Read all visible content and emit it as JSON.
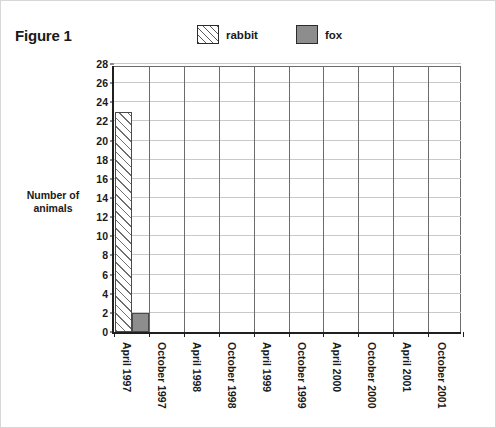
{
  "figure": {
    "title": "Figure 1"
  },
  "legend": {
    "position": "top-center",
    "entries": [
      {
        "label": "rabbit",
        "swatch": "hatched-diagonal-white",
        "color": "#ffffff"
      },
      {
        "label": "fox",
        "swatch": "solid-gray",
        "color": "#8d8d8d"
      }
    ]
  },
  "axes": {
    "y_title_line1": "Number of",
    "y_title_line2": "animals"
  },
  "chart_data": {
    "type": "bar",
    "title": "Figure 1",
    "xlabel": "",
    "ylabel": "Number of animals",
    "ylim": [
      0,
      28
    ],
    "ytick_step": 2,
    "yticks": [
      0,
      2,
      4,
      6,
      8,
      10,
      12,
      14,
      16,
      18,
      20,
      22,
      24,
      26,
      28
    ],
    "ytick_labels": [
      "0",
      "2",
      "4",
      "6",
      "8",
      "10",
      "12",
      "14",
      "16",
      "18",
      "20",
      "22",
      "24",
      "26",
      "28"
    ],
    "grid": "horizontal-and-vertical",
    "legend_position": "top-center",
    "categories": [
      "April 1997",
      "October 1997",
      "April 1998",
      "October 1998",
      "April 1999",
      "October 1999",
      "April 2000",
      "October 2000",
      "April 2001",
      "October 2001"
    ],
    "series": [
      {
        "name": "rabbit",
        "color": "#ffffff",
        "pattern": "diagonal-hatch",
        "values": [
          23,
          0,
          0,
          0,
          0,
          0,
          0,
          0,
          0,
          0
        ]
      },
      {
        "name": "fox",
        "color": "#8d8d8d",
        "pattern": "solid",
        "values": [
          2,
          0,
          0,
          0,
          0,
          0,
          0,
          0,
          0,
          0
        ]
      }
    ]
  }
}
